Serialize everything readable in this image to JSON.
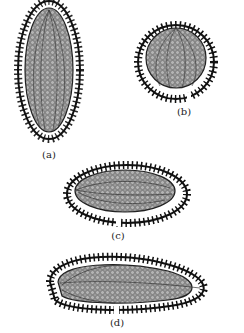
{
  "figure": {
    "panels": [
      {
        "id": "a",
        "label": "(a)",
        "shape": "vertical-oval",
        "label_pos": [
          49,
          152
        ]
      },
      {
        "id": "b",
        "label": "(b)",
        "shape": "round-with-notch",
        "label_pos": [
          184,
          108
        ]
      },
      {
        "id": "c",
        "label": "(c)",
        "shape": "horizontal-oval-with-notch",
        "label_pos": [
          118,
          233
        ]
      },
      {
        "id": "d",
        "label": "(d)",
        "shape": "elongated-with-fold",
        "label_pos": [
          117,
          320
        ]
      }
    ],
    "colors": {
      "inner_fill": "#8f8f8f",
      "wall": "#1a1a1a",
      "cell": "#ffffff"
    }
  }
}
